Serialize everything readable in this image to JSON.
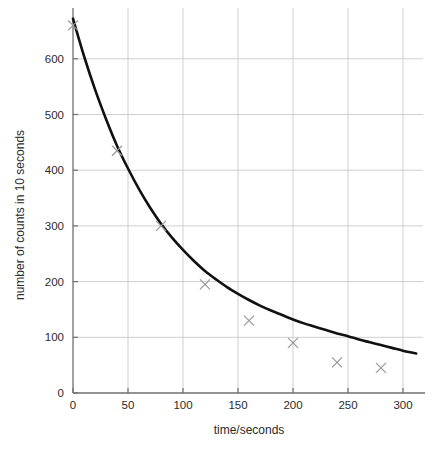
{
  "chart_data": {
    "type": "scatter",
    "title": "",
    "xlabel": "time/seconds",
    "ylabel": "number of counts in 10 seconds",
    "xlim": [
      0,
      315
    ],
    "ylim": [
      0,
      670
    ],
    "xticks": [
      0,
      50,
      100,
      150,
      200,
      250,
      300
    ],
    "xtick_labels": [
      "0",
      "50",
      "100",
      "150",
      "200",
      "250",
      "300"
    ],
    "yticks": [
      0,
      100,
      200,
      300,
      400,
      500,
      600
    ],
    "ytick_labels": [
      "0",
      "100",
      "200",
      "300",
      "400",
      "500",
      "600"
    ],
    "grid": true,
    "legend": "none",
    "series": [
      {
        "name": "measured counts",
        "marker": "x",
        "marker_color": "#9a9a9a",
        "x": [
          0,
          40,
          80,
          120,
          160,
          200,
          240,
          280
        ],
        "values": [
          660,
          435,
          300,
          195,
          130,
          90,
          55,
          45
        ]
      },
      {
        "name": "fitted decay curve",
        "marker": "none",
        "line_color": "#111111",
        "x": [
          0,
          10,
          20,
          30,
          40,
          50,
          60,
          70,
          80,
          90,
          100,
          110,
          120,
          130,
          140,
          150,
          160,
          170,
          180,
          190,
          200,
          210,
          220,
          230,
          240,
          250,
          260,
          270,
          280,
          290,
          300,
          312
        ],
        "values": [
          672,
          605,
          545,
          492,
          444,
          403,
          366,
          333,
          304,
          279,
          257,
          237,
          219,
          204,
          190,
          178,
          167,
          157,
          148,
          140,
          132,
          125,
          119,
          113,
          107,
          102,
          96,
          91,
          86,
          81,
          76,
          71
        ]
      }
    ]
  },
  "axes": {
    "x_axis_label": "time/seconds",
    "y_axis_label": "number of counts in 10 seconds"
  },
  "colors": {
    "curve": "#111111",
    "marker": "#9a9a9a",
    "grid": "#cfcfcf",
    "axis": "#6f6f6f",
    "text": "#2b2b2b",
    "background": "#ffffff"
  }
}
